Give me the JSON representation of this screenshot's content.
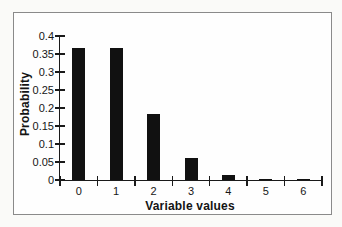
{
  "chart_data": {
    "type": "bar",
    "title": "",
    "xlabel": "Variable values",
    "ylabel": "Probability",
    "categories": [
      "0",
      "1",
      "2",
      "3",
      "4",
      "5",
      "6"
    ],
    "values": [
      0.368,
      0.368,
      0.184,
      0.061,
      0.015,
      0.003,
      0.001
    ],
    "ylim": [
      0,
      0.4
    ],
    "ytick_step": 0.05,
    "ytick_labels": [
      "0",
      "0.05",
      "0.1",
      "0.15",
      "0.2",
      "0.25",
      "0.3",
      "0.35",
      "0.4"
    ],
    "grid": false,
    "legend": false,
    "bar_color": "#111111"
  },
  "colors": {
    "page_background": "#fafaf8",
    "chart_background": "#fefefe",
    "frame_border": "#8a8a8a",
    "axis": "#1a1a1a",
    "text": "#161616",
    "bar": "#111111"
  }
}
